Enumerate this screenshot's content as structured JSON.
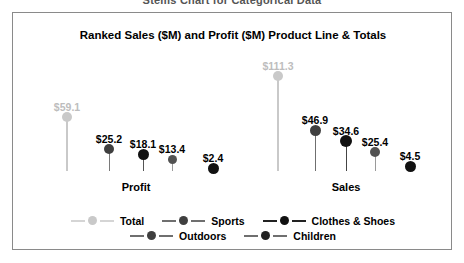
{
  "cutoff_caption": "Stems Chart for Categorical Data",
  "frame": {
    "border_color": "#8a8a8a"
  },
  "chart_data": {
    "type": "scatter",
    "title": "Ranked Sales ($M) and Profit ($M) Product Line & Totals",
    "xlabel": "",
    "ylabel": "",
    "grid": false,
    "legend_position": "bottom",
    "ylim": [
      0,
      120
    ],
    "categories": [
      "Profit",
      "Sales"
    ],
    "series": [
      {
        "name": "Total",
        "color": "#c9c9c9",
        "values": [
          59.1,
          111.3
        ],
        "labels": [
          "$59.1",
          "$111.3"
        ]
      },
      {
        "name": "Sports",
        "color": "#3f3f3f",
        "values": [
          25.2,
          46.9
        ],
        "labels": [
          "$25.2",
          "$46.9"
        ]
      },
      {
        "name": "Clothes & Shoes",
        "color": "#111111",
        "values": [
          18.1,
          34.6
        ],
        "labels": [
          "$18.1",
          "$34.6"
        ]
      },
      {
        "name": "Outdoors",
        "color": "#525252",
        "values": [
          13.4,
          25.4
        ],
        "labels": [
          "$13.4",
          "$25.4"
        ]
      },
      {
        "name": "Children",
        "color": "#111111",
        "values": [
          2.4,
          4.5
        ],
        "labels": [
          "$2.4",
          "$4.5"
        ]
      }
    ]
  },
  "axis": {
    "group_labels": [
      {
        "text": "Profit",
        "x": 123
      },
      {
        "text": "Sales",
        "x": 333
      }
    ]
  },
  "points": [
    {
      "group": "Profit",
      "series": "Total",
      "label": "$59.1",
      "x": 54,
      "dot_y": 104,
      "dot_r": 5,
      "label_y": 88,
      "color": "#c9c9c9",
      "label_color": "#bdbdbd",
      "stem_color": "#c9c9c9",
      "stem_w": 2
    },
    {
      "group": "Profit",
      "series": "Sports",
      "label": "$25.2",
      "x": 96,
      "dot_y": 136,
      "dot_r": 5,
      "label_y": 120,
      "color": "#3f3f3f",
      "label_color": "#000000",
      "stem_color": "#7a7a7a",
      "stem_w": 1
    },
    {
      "group": "Profit",
      "series": "Clothes & Shoes",
      "label": "$18.1",
      "x": 130,
      "dot_y": 141,
      "dot_r": 5.5,
      "label_y": 125,
      "color": "#111111",
      "label_color": "#000000",
      "stem_color": "#555555",
      "stem_w": 1
    },
    {
      "group": "Profit",
      "series": "Outdoors",
      "label": "$13.4",
      "x": 159,
      "dot_y": 146,
      "dot_r": 4.5,
      "label_y": 130,
      "color": "#525252",
      "label_color": "#000000",
      "stem_color": "#9a9a9a",
      "stem_w": 1
    },
    {
      "group": "Profit",
      "series": "Children",
      "label": "$2.4",
      "x": 200,
      "dot_y": 155,
      "dot_r": 5.5,
      "label_y": 139,
      "color": "#111111",
      "label_color": "#000000",
      "stem_color": "#555555",
      "stem_w": 1
    },
    {
      "group": "Sales",
      "series": "Total",
      "label": "$111.3",
      "x": 265,
      "dot_y": 63,
      "dot_r": 5,
      "label_y": 47,
      "color": "#c9c9c9",
      "label_color": "#bdbdbd",
      "stem_color": "#c9c9c9",
      "stem_w": 2
    },
    {
      "group": "Sales",
      "series": "Sports",
      "label": "$46.9",
      "x": 302,
      "dot_y": 117,
      "dot_r": 5.5,
      "label_y": 101,
      "color": "#3f3f3f",
      "label_color": "#000000",
      "stem_color": "#6f6f6f",
      "stem_w": 1
    },
    {
      "group": "Sales",
      "series": "Clothes & Shoes",
      "label": "$34.6",
      "x": 333,
      "dot_y": 128,
      "dot_r": 6,
      "label_y": 112,
      "color": "#111111",
      "label_color": "#000000",
      "stem_color": "#444444",
      "stem_w": 1
    },
    {
      "group": "Sales",
      "series": "Outdoors",
      "label": "$25.4",
      "x": 362,
      "dot_y": 139,
      "dot_r": 5,
      "label_y": 123,
      "color": "#525252",
      "label_color": "#000000",
      "stem_color": "#9a9a9a",
      "stem_w": 1
    },
    {
      "group": "Sales",
      "series": "Children",
      "label": "$4.5",
      "x": 397,
      "dot_y": 153,
      "dot_r": 5.5,
      "label_y": 137,
      "color": "#111111",
      "label_color": "#000000",
      "stem_color": "#555555",
      "stem_w": 1
    }
  ],
  "baseline_y": 158,
  "legend": {
    "rows": [
      [
        {
          "label": "Total",
          "color": "#c9c9c9",
          "line": "#d5d5d5"
        },
        {
          "label": "Sports",
          "color": "#3f3f3f",
          "line": "#6f6f6f"
        },
        {
          "label": "Clothes & Shoes",
          "color": "#111111",
          "line": "#222222"
        }
      ],
      [
        {
          "label": "Outdoors",
          "color": "#3f3f3f",
          "line": "#6f6f6f"
        },
        {
          "label": "Children",
          "color": "#222222",
          "line": "#6f6f6f"
        }
      ]
    ]
  }
}
